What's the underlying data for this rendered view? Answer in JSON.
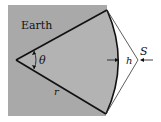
{
  "diagram": {
    "labels": {
      "region": "Earth",
      "angle": "θ",
      "radius": "r",
      "height": "h",
      "point": "S"
    },
    "colors": {
      "earth_fill": "#a9a9a9",
      "line": "#111111",
      "background": "#ffffff"
    }
  }
}
